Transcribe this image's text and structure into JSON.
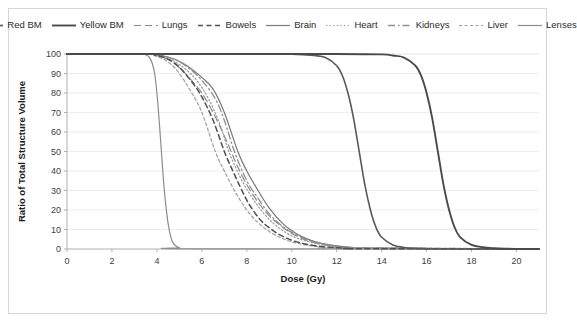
{
  "chart_data": {
    "type": "line",
    "title": "",
    "xlabel": "Dose (Gy)",
    "ylabel": "Ratio of Total Structure Volume",
    "xlim": [
      0,
      21
    ],
    "ylim": [
      0,
      100
    ],
    "xticks": [
      0,
      2,
      4,
      6,
      8,
      10,
      12,
      14,
      16,
      18,
      20
    ],
    "yticks": [
      0,
      10,
      20,
      30,
      40,
      50,
      60,
      70,
      80,
      90,
      100
    ],
    "grid": "horizontal",
    "legend_position": "top",
    "series": [
      {
        "name": "Red BM",
        "style": "solid",
        "color": "#595959",
        "width": 1.6,
        "dash": "none",
        "midpoint": 13.0,
        "slope": 0.95,
        "x": [
          0,
          2,
          4,
          6,
          8,
          10,
          11,
          11.5,
          12,
          12.25,
          12.5,
          12.75,
          13,
          13.25,
          13.5,
          13.75,
          14,
          14.5,
          15,
          15.5,
          16,
          17,
          18,
          20,
          21
        ],
        "y": [
          100,
          100,
          100,
          100,
          100,
          99.9,
          99.2,
          98.2,
          94,
          89,
          80,
          67,
          50,
          33,
          20,
          11,
          6,
          2.1,
          0.8,
          0.3,
          0.1,
          0,
          0,
          0,
          0
        ]
      },
      {
        "name": "Yellow BM",
        "style": "solid",
        "color": "#4a4a4a",
        "width": 1.9,
        "dash": "none",
        "midpoint": 16.5,
        "slope": 0.95,
        "x": [
          0,
          4,
          8,
          12,
          14,
          14.5,
          15,
          15.5,
          15.75,
          16,
          16.25,
          16.5,
          16.75,
          17,
          17.25,
          17.5,
          18,
          18.5,
          19,
          19.5,
          20,
          20.5,
          21
        ],
        "y": [
          100,
          100,
          100,
          100,
          99.8,
          99.2,
          98.2,
          94,
          89,
          80,
          67,
          50,
          33,
          20,
          11,
          6,
          2.1,
          0.9,
          0.4,
          0.15,
          0.05,
          0,
          0
        ]
      },
      {
        "name": "Lungs",
        "style": "long-dash",
        "color": "#8a8a8a",
        "width": 1.2,
        "dash": "7 4",
        "midpoint": 7.3,
        "slope": 0.72,
        "x": [
          0,
          3.4,
          3.8,
          4.2,
          4.6,
          5,
          5.5,
          6,
          6.5,
          7,
          7.3,
          7.6,
          8,
          8.5,
          9,
          9.5,
          10,
          10.5,
          11,
          11.5,
          12,
          12.5,
          13,
          14,
          21
        ],
        "y": [
          100,
          100,
          99.6,
          98.6,
          96.5,
          93,
          87,
          80,
          70,
          58,
          50,
          42,
          33,
          24,
          17,
          12,
          8,
          5.2,
          3.4,
          2.1,
          1.3,
          0.7,
          0.35,
          0.1,
          0
        ]
      },
      {
        "name": "Bowels",
        "style": "dashed",
        "color": "#4f4f4f",
        "width": 1.5,
        "dash": "5 3.5",
        "midpoint": 7.0,
        "slope": 0.75,
        "x": [
          0,
          3.5,
          3.9,
          4.3,
          4.7,
          5.1,
          5.6,
          6,
          6.5,
          7,
          7.3,
          7.7,
          8.1,
          8.6,
          9.1,
          9.6,
          10.1,
          10.6,
          11.1,
          11.6,
          12.1,
          12.6,
          13,
          21
        ],
        "y": [
          100,
          100,
          99.5,
          98.3,
          96,
          92,
          85,
          78,
          66,
          50,
          42,
          32,
          23,
          15,
          10,
          6.5,
          4.1,
          2.6,
          1.6,
          1,
          0.6,
          0.3,
          0.15,
          0
        ]
      },
      {
        "name": "Brain",
        "style": "solid",
        "color": "#787878",
        "width": 1.2,
        "dash": "none",
        "midpoint": 7.6,
        "slope": 0.7,
        "x": [
          0,
          3.6,
          4,
          4.4,
          4.9,
          5.4,
          6,
          6.5,
          7,
          7.6,
          8,
          8.5,
          9,
          9.6,
          10.1,
          10.6,
          11.1,
          11.7,
          12.2,
          12.7,
          13.2,
          21
        ],
        "y": [
          100,
          100,
          99.6,
          98.7,
          96.8,
          93.5,
          88,
          82,
          70,
          50,
          40,
          30,
          21,
          13,
          8.6,
          5.6,
          3.6,
          2.1,
          1.3,
          0.8,
          0.45,
          0
        ]
      },
      {
        "name": "Heart",
        "style": "dotted",
        "color": "#9a9a9a",
        "width": 1.2,
        "dash": "1.4 2.2",
        "midpoint": 7.2,
        "slope": 0.7,
        "x": [
          0,
          3.5,
          3.9,
          4.3,
          4.8,
          5.3,
          5.8,
          6.3,
          6.8,
          7.2,
          7.7,
          8.2,
          8.7,
          9.2,
          9.8,
          10.3,
          10.9,
          11.4,
          12,
          12.5,
          21
        ],
        "y": [
          100,
          100,
          99.5,
          98.4,
          96,
          92,
          86,
          77,
          64,
          50,
          37,
          27,
          19,
          13,
          8,
          5.3,
          3.3,
          2.1,
          1.2,
          0.7,
          0
        ]
      },
      {
        "name": "Kidneys",
        "style": "dash-dot",
        "color": "#8f8f8f",
        "width": 1.3,
        "dash": "7 3 1.5 3",
        "midpoint": 7.45,
        "slope": 0.7,
        "x": [
          0,
          3.6,
          4,
          4.5,
          5,
          5.5,
          6,
          6.6,
          7,
          7.45,
          8,
          8.5,
          9,
          9.5,
          10,
          10.6,
          11.1,
          11.7,
          12.2,
          12.8,
          21
        ],
        "y": [
          100,
          100,
          99.5,
          98.3,
          96,
          92,
          86.5,
          77,
          66,
          50,
          35,
          26,
          18,
          12.5,
          8.5,
          5.2,
          3.4,
          2,
          1.2,
          0.7,
          0
        ]
      },
      {
        "name": "Liver",
        "style": "short-dash",
        "color": "#9e9e9e",
        "width": 1.2,
        "dash": "3 2.5",
        "midpoint": 6.6,
        "slope": 0.78,
        "x": [
          0,
          3.4,
          3.8,
          4.2,
          4.6,
          5,
          5.5,
          6,
          6.6,
          7,
          7.5,
          8,
          8.5,
          9,
          9.5,
          10,
          10.5,
          11,
          11.5,
          12,
          21
        ],
        "y": [
          100,
          100,
          99.4,
          97.8,
          95,
          90,
          81,
          70,
          50,
          40,
          29,
          20,
          13.5,
          9,
          5.8,
          3.7,
          2.3,
          1.4,
          0.8,
          0.4,
          0
        ]
      },
      {
        "name": "Lenses",
        "style": "solid",
        "color": "#8c8c8c",
        "width": 1.2,
        "dash": "none",
        "midpoint": 4.15,
        "slope": 3.6,
        "x": [
          0,
          3.3,
          3.5,
          3.65,
          3.8,
          3.9,
          4,
          4.1,
          4.2,
          4.3,
          4.4,
          4.5,
          4.6,
          4.7,
          4.85,
          5,
          5.5,
          21
        ],
        "y": [
          100,
          100,
          99.6,
          98.5,
          95,
          90,
          80,
          66,
          50,
          34,
          22,
          13,
          7,
          3.5,
          1.5,
          0.7,
          0.1,
          0
        ]
      }
    ]
  }
}
